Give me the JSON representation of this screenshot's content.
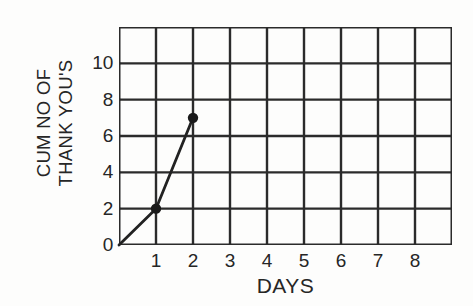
{
  "chart_data": {
    "type": "line",
    "title": "",
    "xlabel": "DAYS",
    "ylabel_line1": "CUM NO OF",
    "ylabel_line2": "THANK YOU'S",
    "x": [
      0,
      1,
      2
    ],
    "values": [
      0,
      2,
      7
    ],
    "series": [
      {
        "name": "cumulative thank yous",
        "points": [
          {
            "x": 0,
            "y": 0,
            "marker": false
          },
          {
            "x": 1,
            "y": 2,
            "marker": true
          },
          {
            "x": 2,
            "y": 7,
            "marker": true
          }
        ]
      }
    ],
    "xlim": [
      0,
      9
    ],
    "ylim": [
      0,
      12
    ],
    "xticks": [
      1,
      2,
      3,
      4,
      5,
      6,
      7,
      8
    ],
    "xtick_labels": [
      "1",
      "2",
      "3",
      "4",
      "5",
      "6",
      "7",
      "8"
    ],
    "yticks": [
      0,
      2,
      4,
      6,
      8,
      10
    ],
    "ytick_labels": [
      "0",
      "2",
      "4",
      "6",
      "8",
      "10"
    ],
    "x_gridlines": [
      0,
      1,
      2,
      3,
      4,
      5,
      6,
      7,
      8,
      9
    ],
    "y_gridlines": [
      0,
      2,
      4,
      6,
      8,
      10,
      12
    ],
    "grid": true,
    "legend": "none",
    "line_color": "#222222",
    "grid_color": "#2b2b2b",
    "marker_color": "#1a1a1a",
    "background_color": "#fdfdfc"
  }
}
